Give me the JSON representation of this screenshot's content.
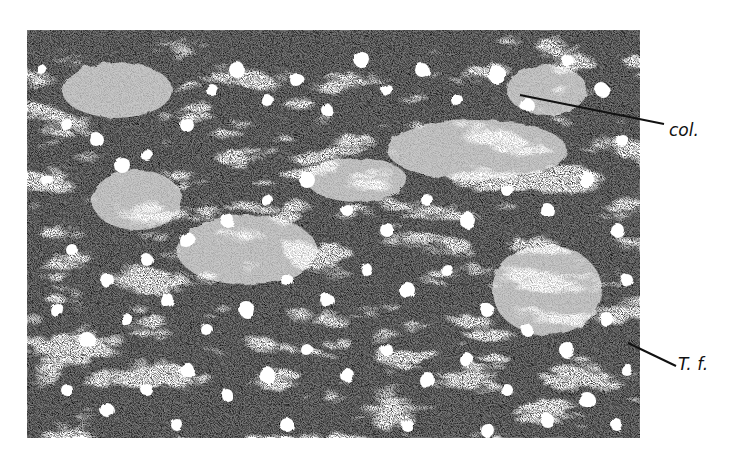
{
  "figure": {
    "background_color": "#ffffff",
    "ink_color": "#111111"
  },
  "labels": [
    {
      "id": "col",
      "text": "col.",
      "x": 669,
      "y": 120
    },
    {
      "id": "tf",
      "text": "T. f.",
      "x": 678,
      "y": 354
    }
  ]
}
